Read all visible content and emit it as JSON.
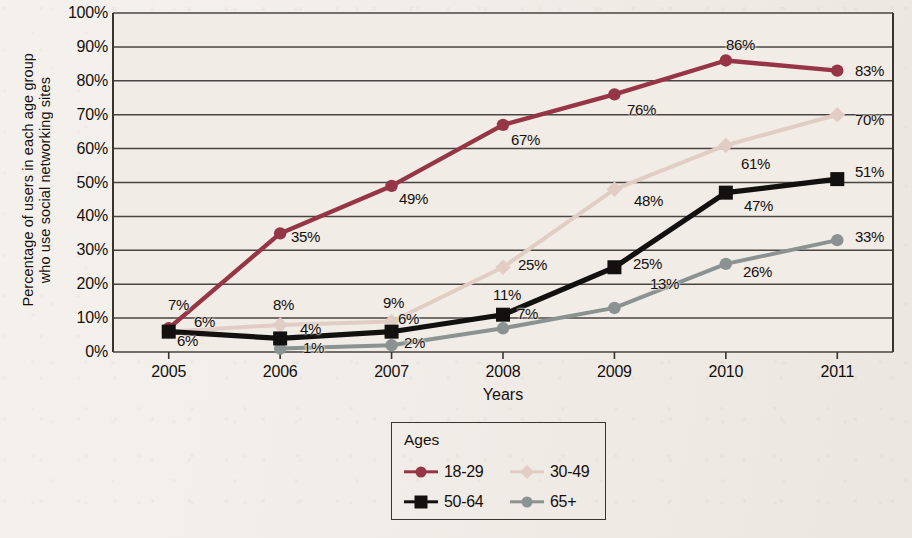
{
  "page": {
    "background_color": "#efeae4"
  },
  "chart_data": {
    "type": "line",
    "title": "",
    "xlabel": "Years",
    "ylabel": "Percentage of users in each age group who use social networking sites",
    "ylabel_line1": "Percentage of users in each age group",
    "ylabel_line2": "who use social networking sites",
    "categories": [
      "2005",
      "2006",
      "2007",
      "2008",
      "2009",
      "2010",
      "2011"
    ],
    "x": [
      2005,
      2006,
      2007,
      2008,
      2009,
      2010,
      2011
    ],
    "ylim": [
      0,
      100
    ],
    "yticks": [
      "0%",
      "10%",
      "20%",
      "30%",
      "40%",
      "50%",
      "60%",
      "70%",
      "80%",
      "90%",
      "100%"
    ],
    "ytick_values": [
      0,
      10,
      20,
      30,
      40,
      50,
      60,
      70,
      80,
      90,
      100
    ],
    "grid": "horizontal",
    "legend_position": "bottom-center",
    "legend_title": "Ages",
    "series": [
      {
        "name": "18-29",
        "color": "#963545",
        "marker": "circle",
        "values": [
          7,
          35,
          49,
          67,
          76,
          86,
          83
        ],
        "labels": [
          "7%",
          "35%",
          "49%",
          "67%",
          "76%",
          "86%",
          "83%"
        ]
      },
      {
        "name": "30-49",
        "color": "#e2cdc5",
        "marker": "diamond",
        "values": [
          6,
          8,
          9,
          25,
          48,
          61,
          70
        ],
        "labels": [
          "6%",
          "8%",
          "9%",
          "25%",
          "48%",
          "61%",
          "70%"
        ]
      },
      {
        "name": "50-64",
        "color": "#121110",
        "marker": "square",
        "values": [
          6,
          4,
          6,
          11,
          25,
          47,
          51
        ],
        "labels": [
          "6%",
          "4%",
          "6%",
          "11%",
          "25%",
          "47%",
          "51%"
        ]
      },
      {
        "name": "65+",
        "color": "#8a9391",
        "marker": "circle",
        "values": [
          null,
          1,
          2,
          7,
          13,
          26,
          33
        ],
        "labels": [
          "",
          "1%",
          "2%",
          "7%",
          "13%",
          "26%",
          "33%"
        ]
      }
    ],
    "data_labels": [
      {
        "text": "7%",
        "x": 168,
        "y": 296,
        "series": "18-29"
      },
      {
        "text": "35%",
        "x": 291,
        "y": 228,
        "series": "18-29"
      },
      {
        "text": "49%",
        "x": 399,
        "y": 190,
        "series": "18-29"
      },
      {
        "text": "67%",
        "x": 511,
        "y": 131,
        "series": "18-29"
      },
      {
        "text": "76%",
        "x": 627,
        "y": 101,
        "series": "18-29"
      },
      {
        "text": "86%",
        "x": 726,
        "y": 36,
        "series": "18-29"
      },
      {
        "text": "83%",
        "x": 855,
        "y": 62,
        "series": "18-29"
      },
      {
        "text": "6%",
        "x": 194,
        "y": 313,
        "series": "30-49"
      },
      {
        "text": "8%",
        "x": 273,
        "y": 296,
        "series": "30-49"
      },
      {
        "text": "9%",
        "x": 383,
        "y": 294,
        "series": "30-49"
      },
      {
        "text": "25%",
        "x": 518,
        "y": 256,
        "series": "30-49"
      },
      {
        "text": "48%",
        "x": 634,
        "y": 192,
        "series": "30-49"
      },
      {
        "text": "61%",
        "x": 741,
        "y": 155,
        "series": "30-49"
      },
      {
        "text": "70%",
        "x": 855,
        "y": 111,
        "series": "30-49"
      },
      {
        "text": "6%",
        "x": 177,
        "y": 332,
        "series": "50-64"
      },
      {
        "text": "4%",
        "x": 300,
        "y": 320,
        "series": "50-64"
      },
      {
        "text": "6%",
        "x": 398,
        "y": 310,
        "series": "50-64"
      },
      {
        "text": "11%",
        "x": 493,
        "y": 286,
        "series": "50-64"
      },
      {
        "text": "25%",
        "x": 633,
        "y": 255,
        "series": "50-64"
      },
      {
        "text": "47%",
        "x": 744,
        "y": 197,
        "series": "50-64"
      },
      {
        "text": "51%",
        "x": 855,
        "y": 163,
        "series": "50-64"
      },
      {
        "text": "1%",
        "x": 303,
        "y": 339,
        "series": "65+"
      },
      {
        "text": "2%",
        "x": 404,
        "y": 334,
        "series": "65+"
      },
      {
        "text": "7%",
        "x": 517,
        "y": 305,
        "series": "65+"
      },
      {
        "text": "13%",
        "x": 650,
        "y": 275,
        "series": "65+"
      },
      {
        "text": "26%",
        "x": 743,
        "y": 263,
        "series": "65+"
      },
      {
        "text": "33%",
        "x": 855,
        "y": 228,
        "series": "65+"
      }
    ]
  }
}
